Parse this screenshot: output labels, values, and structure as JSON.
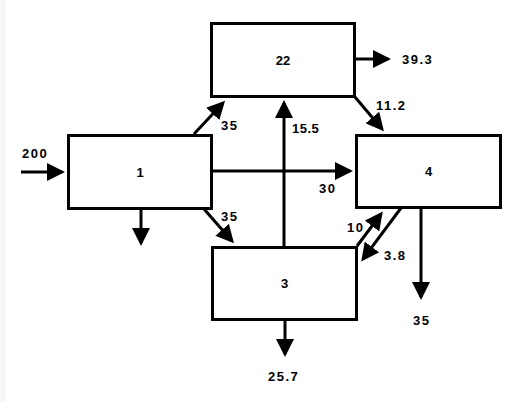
{
  "diagram": {
    "nodes": [
      {
        "id": "1",
        "label": "1"
      },
      {
        "id": "22",
        "label": "22"
      },
      {
        "id": "3",
        "label": "3"
      },
      {
        "id": "4",
        "label": "4"
      }
    ],
    "flows": {
      "input_to_1": "200",
      "n1_to_22": "35",
      "n1_to_3": "35",
      "n1_to_4": "30",
      "n1_out_unlabeled": "",
      "n3_to_22": "15.5",
      "n22_out": "39.3",
      "n22_to_4": "11.2",
      "n3_to_4": "10",
      "n4_to_3": "3.8",
      "n4_out": "35",
      "n3_out": "25.7"
    },
    "colors": {
      "stroke": "#000000",
      "background": "#ffffff"
    }
  }
}
